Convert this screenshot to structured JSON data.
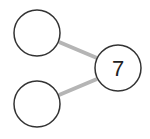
{
  "diagram": {
    "type": "number-bond",
    "whole": {
      "value": "7",
      "cx": 118,
      "cy": 68,
      "r": 23
    },
    "parts": [
      {
        "value": "",
        "cx": 37,
        "cy": 33,
        "r": 23
      },
      {
        "value": "",
        "cx": 37,
        "cy": 104,
        "r": 23
      }
    ],
    "colors": {
      "stroke": "#333333",
      "connector": "#b5b5b5",
      "fill": "#ffffff"
    }
  }
}
